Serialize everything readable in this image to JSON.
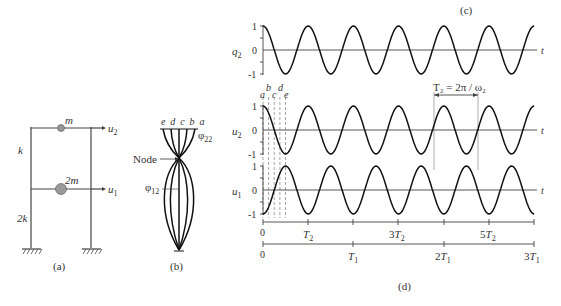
{
  "panel_a": {
    "caption": "(a)",
    "mass_top": "m",
    "mass_bottom": "2m",
    "stiffness_top": "k",
    "stiffness_bottom": "2k",
    "disp_top": "u",
    "disp_top_sub": "2",
    "disp_bottom": "u",
    "disp_bottom_sub": "1"
  },
  "panel_b": {
    "caption": "(b)",
    "curve_labels": "e d c b a",
    "node_label": "Node",
    "phi_top": "φ",
    "phi_top_sub": "22",
    "phi_bottom": "φ",
    "phi_bottom_sub": "12"
  },
  "panel_c": {
    "caption": "(c)"
  },
  "panel_d": {
    "caption": "(d)",
    "period_label": "T₂ = 2π / ω₂",
    "time_markers": [
      "a",
      "b",
      "c",
      "d",
      "e"
    ],
    "axis_t": "t"
  },
  "chart_data": {
    "type": "line",
    "series": [
      {
        "name": "q2",
        "label": "q₂",
        "function": "cos(ω₂ t)",
        "yticks": [
          "1",
          "0",
          "-1"
        ]
      },
      {
        "name": "u2",
        "label": "u₂",
        "function": "φ22 cos(ω₂ t)",
        "yticks": [
          "1",
          "0",
          "-1"
        ]
      },
      {
        "name": "u1",
        "label": "u₁",
        "function": "φ12 cos(ω₂ t) = -cos(ω₂ t)",
        "yticks": [
          "1",
          "0",
          "-1"
        ]
      }
    ],
    "xlabel": "t",
    "x_axis_T2": {
      "ticks": [
        "0",
        "T₂",
        "",
        "3T₂",
        "",
        "5T₂",
        ""
      ],
      "range": [
        0,
        6
      ]
    },
    "x_axis_T1": {
      "ticks": [
        "0",
        "T₁",
        "2T₁",
        "3T₁"
      ],
      "range": [
        0,
        3
      ]
    },
    "ylim": [
      -1,
      1
    ],
    "cycles_shown": 6
  }
}
